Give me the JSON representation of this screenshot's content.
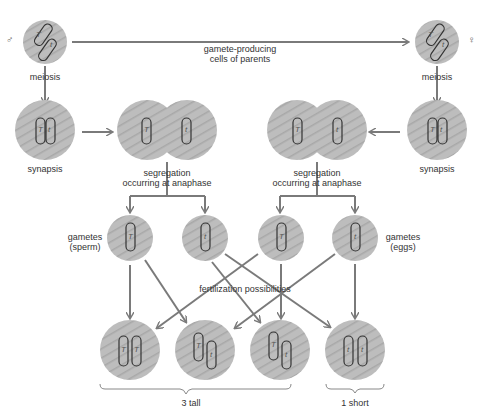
{
  "labels": {
    "male_symbol": "♂",
    "female_symbol": "♀",
    "gamete_line_1": "gamete-producing",
    "gamete_line_2": "cells of parents",
    "meiosis_left": "meiosis",
    "meiosis_right": "meiosis",
    "synapsis_left": "synapsis",
    "synapsis_right": "synapsis",
    "segregation_left_1": "segregation",
    "segregation_left_2": "occurring at anaphase",
    "segregation_right_1": "segregation",
    "segregation_right_2": "occurring at anaphase",
    "gametes_sperm_1": "gametes",
    "gametes_sperm_2": "(sperm)",
    "gametes_eggs_1": "gametes",
    "gametes_eggs_2": "(eggs)",
    "fertilization": "fertilization possibilities",
    "tall_count": "3 tall",
    "short_count": "1 short"
  },
  "alleles": {
    "dominant": "T",
    "recessive": "t"
  },
  "offspring": [
    {
      "genotype": [
        "T",
        "T"
      ]
    },
    {
      "genotype": [
        "T",
        "t"
      ]
    },
    {
      "genotype": [
        "T",
        "t"
      ]
    },
    {
      "genotype": [
        "t",
        "t"
      ]
    }
  ],
  "colors": {
    "cell_fill": "#b8b8b8",
    "arrow": "#7a7a7a",
    "chromosome_stroke": "#333333"
  }
}
